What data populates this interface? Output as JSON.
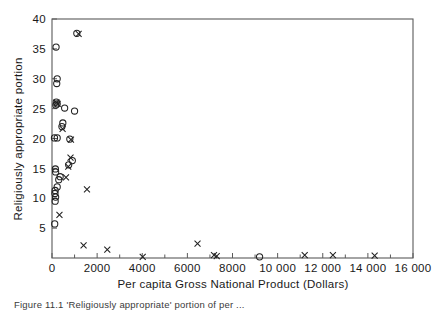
{
  "figure": {
    "caption": "Figure 11.1  'Religiously appropriate' portion of per ...",
    "background_color": "#ffffff",
    "marker_color": "#222222",
    "axis_color": "#5a5a5a"
  },
  "chart_data": {
    "type": "scatter",
    "title": "",
    "xlabel": "Per capita Gross National Product (Dollars)",
    "ylabel": "Religiously appropriate portion",
    "xlim": [
      0,
      16000
    ],
    "ylim": [
      0,
      40
    ],
    "grid": false,
    "legend": null,
    "xticks": [
      0,
      2000,
      4000,
      6000,
      8000,
      10000,
      12000,
      14000,
      16000
    ],
    "xticklabels": [
      "0",
      "2000",
      "4000",
      "6000",
      "8000",
      "10 000",
      "12 000",
      "14 000",
      "16 000"
    ],
    "xminorticks": [
      1000,
      3000,
      5000,
      7000,
      9000,
      11000,
      13000,
      15000
    ],
    "yticks": [
      5,
      10,
      15,
      20,
      25,
      30,
      35,
      40
    ],
    "yticklabels": [
      "5",
      "10",
      "15",
      "20",
      "25",
      "30",
      "35",
      "40"
    ],
    "series": [
      {
        "name": "circle-markers",
        "marker": "circle",
        "points": [
          [
            1100,
            37.6
          ],
          [
            180,
            35.3
          ],
          [
            230,
            30.0
          ],
          [
            210,
            29.2
          ],
          [
            190,
            26.1
          ],
          [
            230,
            25.8
          ],
          [
            170,
            25.6
          ],
          [
            560,
            25.1
          ],
          [
            1000,
            24.6
          ],
          [
            480,
            22.6
          ],
          [
            440,
            22.0
          ],
          [
            110,
            20.1
          ],
          [
            230,
            20.1
          ],
          [
            790,
            19.9
          ],
          [
            900,
            16.3
          ],
          [
            740,
            15.6
          ],
          [
            150,
            14.9
          ],
          [
            160,
            14.4
          ],
          [
            360,
            13.6
          ],
          [
            300,
            13.1
          ],
          [
            230,
            11.9
          ],
          [
            140,
            11.3
          ],
          [
            130,
            10.8
          ],
          [
            160,
            10.2
          ],
          [
            140,
            9.5
          ],
          [
            120,
            5.7
          ],
          [
            9200,
            0.2
          ]
        ]
      },
      {
        "name": "cross-markers",
        "marker": "cross",
        "points": [
          [
            1180,
            37.5
          ],
          [
            200,
            26.0
          ],
          [
            250,
            25.8
          ],
          [
            470,
            21.6
          ],
          [
            840,
            19.8
          ],
          [
            820,
            16.8
          ],
          [
            720,
            15.3
          ],
          [
            620,
            13.5
          ],
          [
            1550,
            11.5
          ],
          [
            330,
            7.2
          ],
          [
            1400,
            2.1
          ],
          [
            2450,
            1.4
          ],
          [
            4020,
            0.2
          ],
          [
            6450,
            2.4
          ],
          [
            7180,
            0.5
          ],
          [
            7300,
            0.3
          ],
          [
            11200,
            0.5
          ],
          [
            12450,
            0.5
          ],
          [
            14300,
            0.4
          ]
        ]
      }
    ]
  }
}
